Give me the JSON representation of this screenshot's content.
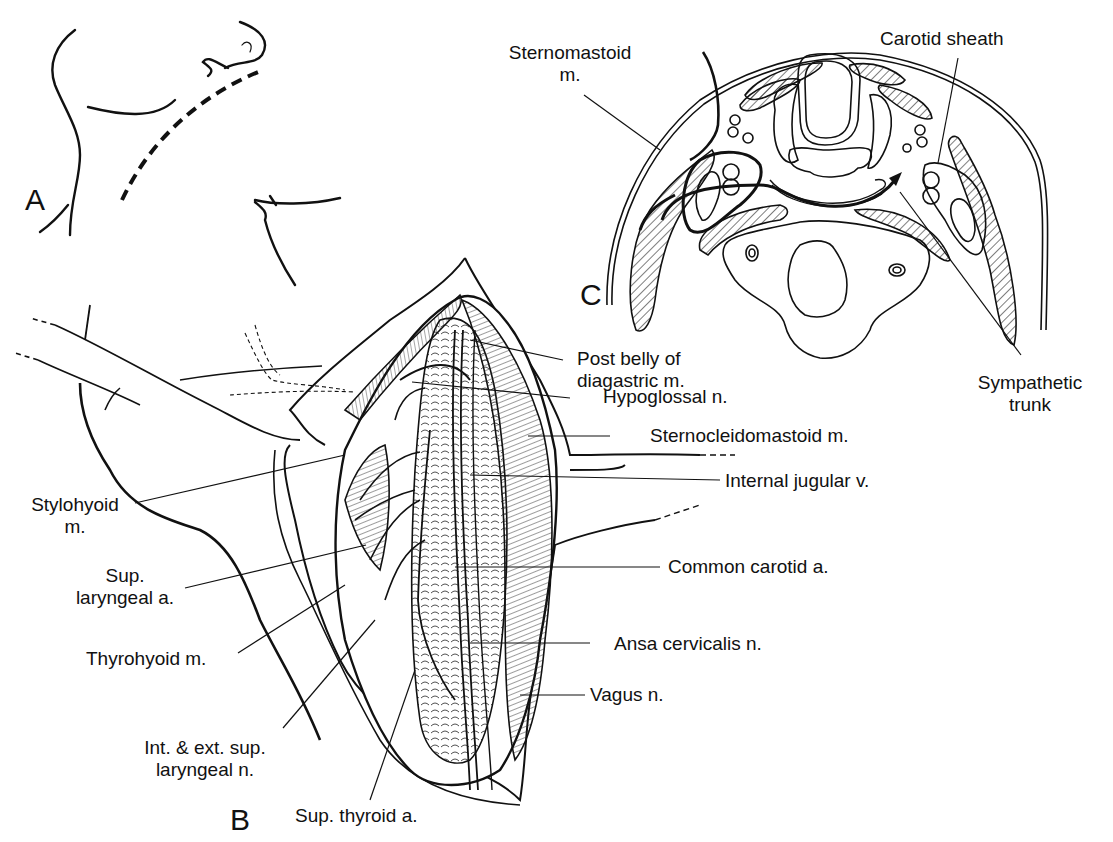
{
  "figure": {
    "panels": [
      {
        "id": "A",
        "label": "A"
      },
      {
        "id": "B",
        "label": "B"
      },
      {
        "id": "C",
        "label": "C"
      }
    ],
    "labels": {
      "sternomastoid_1": "Sternomastoid",
      "sternomastoid_2": "m.",
      "carotid_sheath": "Carotid sheath",
      "sympathetic_1": "Sympathetic",
      "sympathetic_2": "trunk",
      "post_belly_1": "Post belly of",
      "post_belly_2": "diagastric m.",
      "hypoglossal": "Hypoglossal n.",
      "sternocleidomastoid": "Sternocleidomastoid m.",
      "internal_jugular": "Internal jugular v.",
      "common_carotid": "Common carotid a.",
      "ansa_cervicalis": "Ansa cervicalis n.",
      "vagus": "Vagus n.",
      "stylohyoid_1": "Stylohyoid",
      "stylohyoid_2": "m.",
      "sup_laryngeal_a_1": "Sup.",
      "sup_laryngeal_a_2": "laryngeal a.",
      "thyrohyoid": "Thyrohyoid m.",
      "int_ext_1": "Int. & ext. sup.",
      "int_ext_2": "laryngeal n.",
      "sup_thyroid": "Sup. thyroid a."
    },
    "colors": {
      "ink": "#111111",
      "background": "#ffffff"
    }
  }
}
